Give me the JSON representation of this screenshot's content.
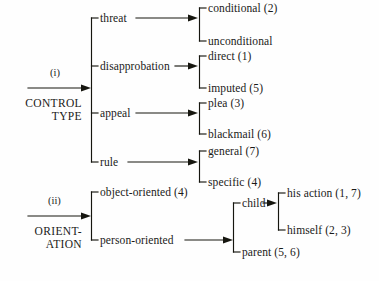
{
  "diagram": {
    "type": "tree-taxonomy",
    "title": "",
    "branches": [
      {
        "id": "i",
        "roman": "(i)",
        "root_label_lines": [
          "CONTROL",
          "TYPE"
        ],
        "root_label": "CONTROL TYPE",
        "children": [
          {
            "label": "threat",
            "children": [
              {
                "label": "conditional (2)"
              },
              {
                "label": "unconditional"
              }
            ]
          },
          {
            "label": "disapprobation",
            "children": [
              {
                "label": "direct (1)"
              },
              {
                "label": "imputed (5)"
              }
            ]
          },
          {
            "label": "appeal",
            "children": [
              {
                "label": "plea (3)"
              },
              {
                "label": "blackmail (6)"
              }
            ]
          },
          {
            "label": "rule",
            "children": [
              {
                "label": "general (7)"
              },
              {
                "label": "specific (4)"
              }
            ]
          }
        ]
      },
      {
        "id": "ii",
        "roman": "(ii)",
        "root_label_lines": [
          "ORIENT-",
          "ATION"
        ],
        "root_label": "ORIENT-ATION",
        "children": [
          {
            "label": "object-oriented (4)",
            "children": []
          },
          {
            "label": "person-oriented",
            "children": [
              {
                "label": "child",
                "children": [
                  {
                    "label": "his action (1, 7)"
                  },
                  {
                    "label": "himself (2, 3)"
                  }
                ]
              },
              {
                "label": "parent (5, 6)"
              }
            ]
          }
        ]
      }
    ],
    "ink_color": "#16160f",
    "background_color": "#fefefe"
  }
}
